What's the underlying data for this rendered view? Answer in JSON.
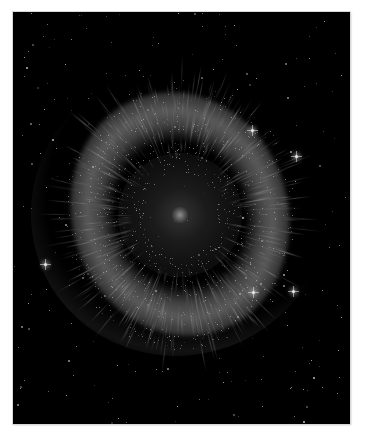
{
  "image": {
    "subject": "Helix Nebula",
    "description": "Ring-shaped planetary nebula in grayscale against a black star field, framed with a white border",
    "frame": {
      "left": 13,
      "top": 12,
      "width": 337,
      "height": 412,
      "border_color": "#ffffff"
    },
    "colors": {
      "background": "#000000",
      "nebula": "#9a9a9a",
      "stars": "#ffffff"
    },
    "nebula_center": {
      "x": 180,
      "y": 215
    },
    "bright_stars": [
      {
        "x": 252,
        "y": 130
      },
      {
        "x": 296,
        "y": 156
      },
      {
        "x": 253,
        "y": 292
      },
      {
        "x": 293,
        "y": 291
      },
      {
        "x": 45,
        "y": 264
      }
    ]
  }
}
